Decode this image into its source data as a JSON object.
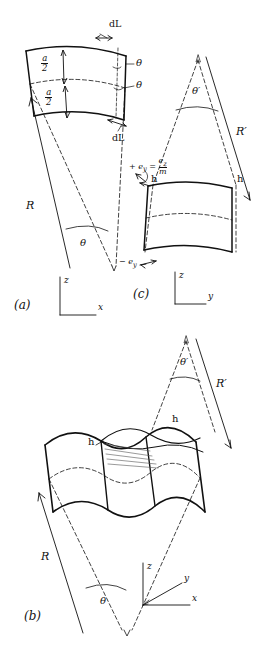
{
  "figure": {
    "type": "technical-line-diagram",
    "background": "#ffffff",
    "ink": "#111111"
  },
  "panels": {
    "a": {
      "id": "(a)",
      "labels": {
        "thickness_upper": {
          "num": "a",
          "den": "2"
        },
        "thickness_lower": {
          "num": "a",
          "den": "2"
        },
        "dl_top": "dL",
        "dl_bottom": "dL",
        "theta_upper": "θ",
        "theta_lower": "θ",
        "radius": "R",
        "angle": "θ"
      },
      "axes": {
        "vertical": "z",
        "horizontal": "x"
      }
    },
    "b": {
      "id": "(b)",
      "labels": {
        "radius": "R",
        "angle": "θ",
        "radius_prime": "R′",
        "angle_prime": "θ′",
        "h_left": "h",
        "h_right": "h"
      },
      "axes": {
        "vertical": "z",
        "diagonal": "y",
        "horizontal": "x"
      }
    },
    "c": {
      "id": "(c)",
      "labels": {
        "radius_prime": "R′",
        "angle_prime": "θ′",
        "h_left": "h",
        "h_right": "h",
        "strain_positive": {
          "lhs": "+ e",
          "lhs_sub": "y",
          "eq": "=",
          "num": "e",
          "num_sub": "z",
          "den": "m"
        },
        "strain_negative": {
          "text": "− e",
          "sub": "y"
        }
      },
      "axes": {
        "vertical": "z",
        "horizontal": "y"
      }
    }
  }
}
